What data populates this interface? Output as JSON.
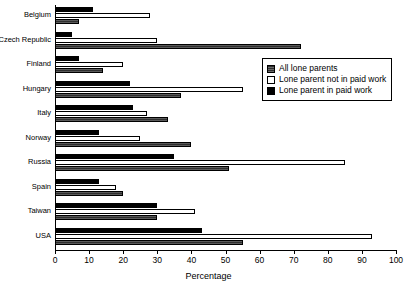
{
  "chart_data": {
    "type": "bar",
    "orientation": "horizontal",
    "title": "",
    "xlabel": "Percentage",
    "ylabel": "",
    "xlim": [
      0,
      100
    ],
    "xticks": [
      0,
      10,
      20,
      30,
      40,
      50,
      60,
      70,
      80,
      90,
      100
    ],
    "grid": false,
    "legend_position": "upper right",
    "categories": [
      "Belgium",
      "Czech Republic",
      "Finland",
      "Hungary",
      "Italy",
      "Norway",
      "Russia",
      "Spain",
      "Taiwan",
      "USA"
    ],
    "series": [
      {
        "name": "All lone parents",
        "key": "all",
        "color": "#4a4a4a",
        "values": [
          7,
          72,
          14,
          37,
          33,
          40,
          51,
          20,
          30,
          55
        ]
      },
      {
        "name": "Lone parent not in paid work",
        "key": "notwork",
        "color": "#ffffff",
        "values": [
          28,
          30,
          20,
          55,
          27,
          25,
          85,
          18,
          41,
          93
        ]
      },
      {
        "name": "Lone parent in paid work",
        "key": "inwork",
        "color": "#000000",
        "values": [
          11,
          5,
          7,
          22,
          23,
          13,
          35,
          13,
          30,
          43
        ]
      }
    ]
  },
  "legend": {
    "items": [
      {
        "label": "All lone parents",
        "key": "all"
      },
      {
        "label": "Lone parent not in paid work",
        "key": "notwork"
      },
      {
        "label": "Lone parent in paid work",
        "key": "inwork"
      }
    ]
  }
}
